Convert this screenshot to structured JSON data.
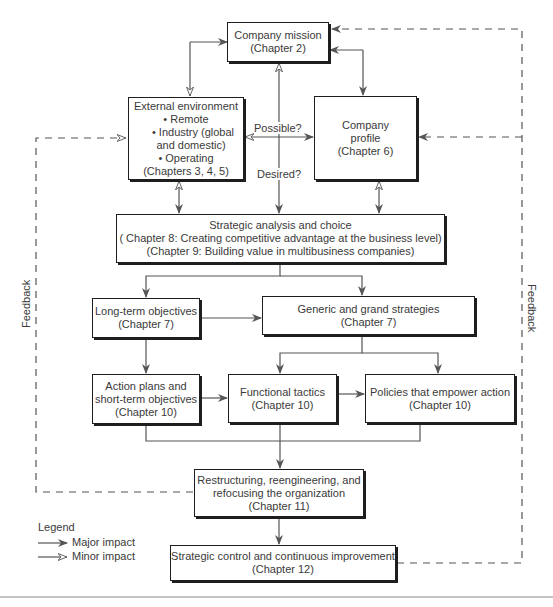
{
  "diagram": {
    "boxes": {
      "mission": {
        "title": "Company mission",
        "chapter": "(Chapter 2)"
      },
      "external": {
        "title": "External environment",
        "bullets": [
          "• Remote",
          "• Industry (global",
          "and domestic)",
          "• Operating"
        ],
        "chapter": "(Chapters 3, 4, 5)"
      },
      "profile": {
        "line1": "Company",
        "line2": "profile",
        "chapter": "(Chapter 6)"
      },
      "strategic": {
        "title": "Strategic analysis and choice",
        "line2": "( Chapter 8: Creating competitive advantage at the business level)",
        "line3": "(Chapter 9: Building value in multibusiness companies)"
      },
      "longterm": {
        "title": "Long-term objectives",
        "chapter": "(Chapter 7)"
      },
      "generic": {
        "title": "Generic and grand strategies",
        "chapter": "(Chapter 7)"
      },
      "action": {
        "line1": "Action plans and",
        "line2": "short-term objectives",
        "chapter": "(Chapter 10)"
      },
      "functional": {
        "title": "Functional tactics",
        "chapter": "(Chapter 10)"
      },
      "policies": {
        "title": "Policies that empower action",
        "chapter": "(Chapter 10)"
      },
      "restructuring": {
        "line1": "Restructuring, reengineering, and",
        "line2": "refocusing the organization",
        "chapter": "(Chapter 11)"
      },
      "control": {
        "title": "Strategic control and continuous improvement",
        "chapter": "(Chapter 12)"
      }
    },
    "edge_labels": {
      "possible": "Possible?",
      "desired": "Desired?"
    },
    "feedback_left": "Feedback",
    "feedback_right": "Feedback",
    "legend": {
      "title": "Legend",
      "major": "Major impact",
      "minor": "Minor impact"
    },
    "colors": {
      "line": "#555555",
      "box_border": "#1e1e1e",
      "text": "#3a3a3a",
      "rule": "#c4c4c4"
    }
  }
}
